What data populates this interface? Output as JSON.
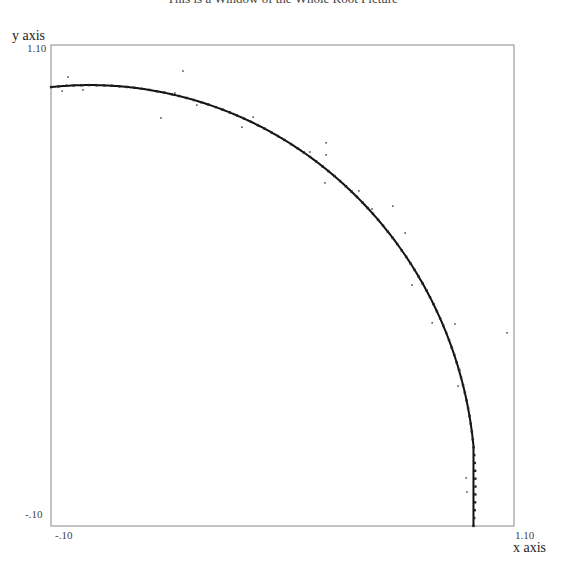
{
  "chart_data": {
    "type": "scatter",
    "title": "This is a Window of the Whole Root Picture",
    "xlabel": "x axis",
    "ylabel": "y axis",
    "xlim": [
      -0.1,
      1.1
    ],
    "ylim": [
      -0.1,
      1.1
    ],
    "tick_labels": {
      "x_min": "-.10",
      "x_max": "1.10",
      "y_min": "-.10",
      "y_max": "1.10"
    },
    "grid": false,
    "legend": null,
    "series": [
      {
        "name": "root locus curve",
        "kind": "line",
        "description": "arc of unit circle x^2 + y^2 = 1 in the first quadrant",
        "center": [
          0,
          0
        ],
        "radius": 1.0,
        "x_range": [
          -0.1,
          0.995
        ],
        "color": "#111111"
      },
      {
        "name": "scattered roots",
        "kind": "points",
        "color": "#555555",
        "points": [
          [
            -0.056,
            1.02
          ],
          [
            -0.071,
            0.985
          ],
          [
            -0.017,
            0.988
          ],
          [
            0.242,
            1.035
          ],
          [
            0.185,
            0.918
          ],
          [
            0.221,
            0.98
          ],
          [
            0.278,
            0.95
          ],
          [
            0.424,
            0.92
          ],
          [
            0.395,
            0.895
          ],
          [
            0.571,
            0.833
          ],
          [
            0.61,
            0.756
          ],
          [
            0.613,
            0.826
          ],
          [
            0.613,
            0.856
          ],
          [
            0.698,
            0.736
          ],
          [
            0.732,
            0.691
          ],
          [
            0.786,
            0.698
          ],
          [
            0.818,
            0.631
          ],
          [
            0.836,
            0.501
          ],
          [
            0.888,
            0.407
          ],
          [
            0.947,
            0.404
          ],
          [
            1.082,
            0.382
          ],
          [
            0.96,
            0.289
          ],
          [
            0.955,
            0.249
          ],
          [
            0.976,
            0.02
          ],
          [
            0.978,
            -0.015
          ]
        ]
      }
    ]
  },
  "labels": {
    "title": "This is a Window of the Whole Root Picture",
    "x_axis": "x axis",
    "y_axis": "y axis",
    "x_min": "-.10",
    "x_max": "1.10",
    "y_min": "-.10",
    "y_max": "1.10"
  }
}
